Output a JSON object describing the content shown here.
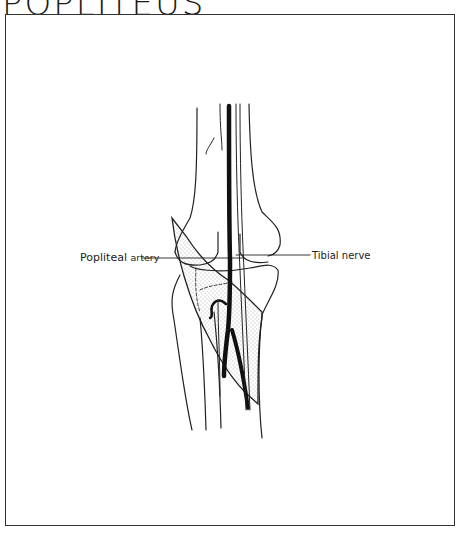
{
  "figure": {
    "title": "POPLITEUS",
    "labels": {
      "popliteal_artery_main": "Popliteal",
      "popliteal_artery_sub": "artery",
      "tibial_nerve": "Tibial nerve"
    }
  },
  "colors": {
    "ink": "#222222",
    "frame": "#333333",
    "background": "#ffffff",
    "stipple": "#555555"
  }
}
